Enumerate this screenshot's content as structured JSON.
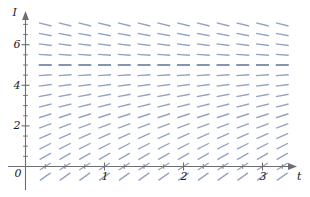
{
  "chart_data": {
    "type": "line",
    "subtype": "slope-field",
    "title": "",
    "xlabel": "t",
    "ylabel": "I",
    "xlim": [
      -0.15,
      3.35
    ],
    "ylim": [
      -0.85,
      7.6
    ],
    "grid": false,
    "legend": null,
    "x_ticks": [
      1,
      2,
      3
    ],
    "x_tick_labels": [
      "1",
      "2",
      "3"
    ],
    "y_ticks": [
      0,
      2,
      4,
      6
    ],
    "y_tick_labels": [
      "0",
      "2",
      "4",
      "6"
    ],
    "minor_x_tick_step": 0.25,
    "minor_y_tick_step": 0.5,
    "axis_arrow_x": true,
    "axis_arrow_y": true,
    "equilibrium_value": 5,
    "slope_formula": "dI/dt = k * (5 - I)",
    "slope_field": {
      "t_values": [
        0.25,
        0.5,
        0.75,
        1,
        1.25,
        1.5,
        1.75,
        2,
        2.25,
        2.5,
        2.75,
        3,
        3.25
      ],
      "I_values": [
        -0.5,
        0,
        0.5,
        1,
        1.5,
        2,
        2.5,
        3,
        3.5,
        4,
        4.5,
        5,
        5.5,
        6,
        6.5,
        7
      ],
      "slopes_by_I": [
        2.75,
        2.5,
        2.25,
        2,
        1.75,
        1.5,
        1.25,
        1,
        0.75,
        0.5,
        0.25,
        0,
        -0.25,
        -0.5,
        -0.75,
        -1
      ],
      "description": "Slopes depend only on I: positive and steepest far below I=5, zero at I=5, negative above I=5."
    },
    "colors": {
      "mark": "#93a3c2",
      "mark_dark": "#7f8fb0",
      "axis": "#6e6e72",
      "text": "#1a1a1a",
      "background": "#ffffff"
    },
    "mark_length_px": 13
  }
}
